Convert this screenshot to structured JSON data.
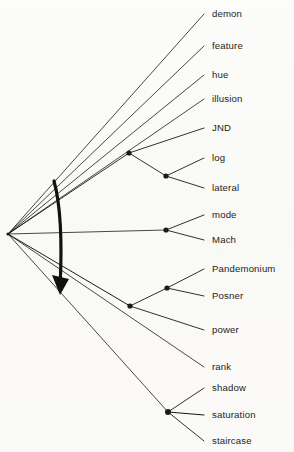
{
  "figure": {
    "kind": "dendrogram",
    "background_color": "#fbfbf9",
    "ink_color": "#1a1a1a",
    "annotation_color": "#111111",
    "leaf_label_x": 212,
    "root": {
      "x": 8,
      "y": 234
    }
  },
  "leaves": [
    {
      "name": "demon",
      "label": "demon",
      "x": 212,
      "y": 14,
      "tip_x": 204,
      "tip_y": 14
    },
    {
      "name": "feature",
      "label": "feature",
      "x": 212,
      "y": 46,
      "tip_x": 204,
      "tip_y": 46
    },
    {
      "name": "hue",
      "label": "hue",
      "x": 212,
      "y": 75,
      "tip_x": 204,
      "tip_y": 75
    },
    {
      "name": "illusion",
      "label": "illusion",
      "x": 212,
      "y": 99,
      "tip_x": 204,
      "tip_y": 99
    },
    {
      "name": "jnd",
      "label": "JND",
      "x": 212,
      "y": 128,
      "tip_x": 204,
      "tip_y": 128
    },
    {
      "name": "log",
      "label": "log",
      "x": 212,
      "y": 158,
      "tip_x": 204,
      "tip_y": 158
    },
    {
      "name": "lateral",
      "label": "lateral",
      "x": 212,
      "y": 188,
      "tip_x": 204,
      "tip_y": 188
    },
    {
      "name": "mode",
      "label": "mode",
      "x": 212,
      "y": 215,
      "tip_x": 204,
      "tip_y": 215
    },
    {
      "name": "mach",
      "label": "Mach",
      "x": 212,
      "y": 240,
      "tip_x": 204,
      "tip_y": 240
    },
    {
      "name": "pandemonium",
      "label": "Pandemonium",
      "x": 212,
      "y": 269,
      "tip_x": 204,
      "tip_y": 269
    },
    {
      "name": "posner",
      "label": "Posner",
      "x": 212,
      "y": 296,
      "tip_x": 204,
      "tip_y": 296
    },
    {
      "name": "power",
      "label": "power",
      "x": 212,
      "y": 330,
      "tip_x": 204,
      "tip_y": 330
    },
    {
      "name": "rank",
      "label": "rank",
      "x": 212,
      "y": 367,
      "tip_x": 204,
      "tip_y": 367
    },
    {
      "name": "shadow",
      "label": "shadow",
      "x": 212,
      "y": 388,
      "tip_x": 204,
      "tip_y": 388
    },
    {
      "name": "saturation",
      "label": "saturation",
      "x": 212,
      "y": 415,
      "tip_x": 204,
      "tip_y": 415
    },
    {
      "name": "staircase",
      "label": "staircase",
      "x": 212,
      "y": 441,
      "tip_x": 204,
      "tip_y": 441
    }
  ],
  "nodes": [
    {
      "name": "node-jnd-log-lateral",
      "x": 129,
      "y": 153,
      "r": 2.6
    },
    {
      "name": "node-log-lateral",
      "x": 166,
      "y": 176,
      "r": 2.6
    },
    {
      "name": "node-mode-mach",
      "x": 166,
      "y": 230,
      "r": 2.6
    },
    {
      "name": "node-pandemonium-posner-power",
      "x": 130,
      "y": 306,
      "r": 2.6
    },
    {
      "name": "node-pandemonium-posner",
      "x": 167,
      "y": 288,
      "r": 2.6
    },
    {
      "name": "node-shadow-saturation-staircase",
      "x": 168,
      "y": 412,
      "r": 3.0
    }
  ],
  "edges": [
    {
      "name": "edge-root-demon",
      "x1": 8,
      "y1": 234,
      "x2": 204,
      "y2": 14,
      "w": 0.8
    },
    {
      "name": "edge-root-feature",
      "x1": 8,
      "y1": 234,
      "x2": 204,
      "y2": 46,
      "w": 0.8
    },
    {
      "name": "edge-root-hue",
      "x1": 8,
      "y1": 234,
      "x2": 204,
      "y2": 75,
      "w": 0.8
    },
    {
      "name": "edge-root-illusion",
      "x1": 8,
      "y1": 234,
      "x2": 204,
      "y2": 99,
      "w": 0.8
    },
    {
      "name": "edge-root-cluster-jnd",
      "x1": 8,
      "y1": 234,
      "x2": 129,
      "y2": 153,
      "w": 0.9
    },
    {
      "name": "edge-cluster-jnd-leaf",
      "x1": 129,
      "y1": 153,
      "x2": 204,
      "y2": 128,
      "w": 0.9
    },
    {
      "name": "edge-cluster-jnd-sub",
      "x1": 129,
      "y1": 153,
      "x2": 166,
      "y2": 176,
      "w": 0.9
    },
    {
      "name": "edge-sub-log",
      "x1": 166,
      "y1": 176,
      "x2": 204,
      "y2": 158,
      "w": 0.9
    },
    {
      "name": "edge-sub-lateral",
      "x1": 166,
      "y1": 176,
      "x2": 204,
      "y2": 188,
      "w": 0.9
    },
    {
      "name": "edge-root-modemach",
      "x1": 8,
      "y1": 234,
      "x2": 166,
      "y2": 230,
      "w": 0.8
    },
    {
      "name": "edge-modemach-mode",
      "x1": 166,
      "y1": 230,
      "x2": 204,
      "y2": 215,
      "w": 0.9
    },
    {
      "name": "edge-modemach-mach",
      "x1": 166,
      "y1": 230,
      "x2": 204,
      "y2": 240,
      "w": 0.9
    },
    {
      "name": "edge-root-pcluster",
      "x1": 8,
      "y1": 234,
      "x2": 130,
      "y2": 306,
      "w": 1.0
    },
    {
      "name": "edge-pcluster-pp",
      "x1": 130,
      "y1": 306,
      "x2": 167,
      "y2": 288,
      "w": 0.9
    },
    {
      "name": "edge-pp-pandemonium",
      "x1": 167,
      "y1": 288,
      "x2": 204,
      "y2": 269,
      "w": 0.9
    },
    {
      "name": "edge-pp-posner",
      "x1": 167,
      "y1": 288,
      "x2": 204,
      "y2": 296,
      "w": 0.9
    },
    {
      "name": "edge-pcluster-power",
      "x1": 130,
      "y1": 306,
      "x2": 204,
      "y2": 330,
      "w": 0.9
    },
    {
      "name": "edge-root-rank",
      "x1": 8,
      "y1": 234,
      "x2": 204,
      "y2": 367,
      "w": 0.8
    },
    {
      "name": "edge-root-scluster",
      "x1": 8,
      "y1": 234,
      "x2": 168,
      "y2": 412,
      "w": 0.8
    },
    {
      "name": "edge-scluster-shadow",
      "x1": 168,
      "y1": 412,
      "x2": 204,
      "y2": 388,
      "w": 0.9
    },
    {
      "name": "edge-scluster-saturation",
      "x1": 168,
      "y1": 412,
      "x2": 204,
      "y2": 415,
      "w": 1.1
    },
    {
      "name": "edge-scluster-staircase",
      "x1": 168,
      "y1": 412,
      "x2": 204,
      "y2": 441,
      "w": 0.9
    }
  ],
  "annotation_arrow": {
    "name": "hand-drawn-curved-arrow",
    "path": "M 54 181 C 62 210, 62 248, 60 288",
    "stroke_width": 3.2,
    "head": "M 60 295 L 52 275 L 69 279 Z"
  }
}
